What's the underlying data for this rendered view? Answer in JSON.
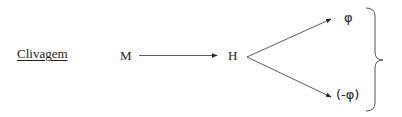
{
  "title": "Clivagem",
  "nodes": {
    "start": "M",
    "intermediate": "H",
    "product_top": "φ",
    "product_bottom": "(-φ)"
  },
  "edges": [
    {
      "from": "M",
      "to": "H"
    },
    {
      "from": "H",
      "to": "φ"
    },
    {
      "from": "H",
      "to": "(-φ)"
    }
  ],
  "grouping": {
    "symbol": "right-curly-brace",
    "groups": [
      "φ",
      "(-φ)"
    ]
  },
  "colors": {
    "ink": "#222222",
    "background": "#ffffff"
  }
}
